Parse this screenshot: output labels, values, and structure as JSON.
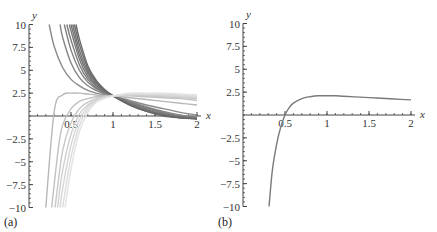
{
  "chart_data": [
    {
      "type": "line",
      "panel_label": "(a)",
      "title": "",
      "xlabel": "x",
      "ylabel": "y",
      "xlim": [
        0,
        2
      ],
      "ylim": [
        -10,
        10
      ],
      "x_ticks": [
        0.5,
        1,
        1.5,
        2
      ],
      "x_tick_labels": [
        "0.5",
        "1",
        "1.5",
        "2"
      ],
      "y_ticks": [
        -10,
        -7.5,
        -5,
        -2.5,
        2.5,
        5,
        7.5,
        10
      ],
      "y_tick_labels": [
        "−10",
        "−7.5",
        "−5",
        "−2.5",
        "2.5",
        "5",
        "7.5",
        "10"
      ],
      "grid": false,
      "legend": "none",
      "description": "Family of solution curves converging at (1, 2.2); upper curves diverge to +10 near x=0.24-0.55, lower curves diverge to -10 near x=0.21-0.40; fan spreads from y~2.5 to y~-0.3 at x=2",
      "series": [
        {
          "name": "upper-1",
          "color": "#8a8a8a",
          "x": [
            0.24,
            0.3,
            0.4,
            0.5,
            0.6,
            0.7,
            0.8,
            0.9,
            1.0,
            1.2,
            1.4,
            1.6,
            1.8,
            2.0
          ],
          "y": [
            10,
            7.6,
            5.3,
            4.0,
            3.3,
            2.8,
            2.5,
            2.3,
            2.2,
            1.7,
            1.2,
            0.8,
            0.4,
            0.1
          ]
        },
        {
          "name": "upper-2",
          "color": "#858585",
          "x": [
            0.37,
            0.4,
            0.5,
            0.6,
            0.7,
            0.8,
            0.9,
            1.0,
            1.2,
            1.4,
            1.6,
            1.8,
            2.0
          ],
          "y": [
            10,
            8.6,
            5.8,
            4.2,
            3.3,
            2.8,
            2.4,
            2.2,
            1.6,
            1.0,
            0.5,
            0.1,
            -0.1
          ]
        },
        {
          "name": "upper-3",
          "color": "#808080",
          "x": [
            0.42,
            0.5,
            0.6,
            0.7,
            0.8,
            0.9,
            1.0,
            1.2,
            1.4,
            1.6,
            1.8,
            2.0
          ],
          "y": [
            10,
            7.2,
            5.0,
            3.7,
            3.0,
            2.5,
            2.2,
            1.5,
            0.9,
            0.4,
            0.0,
            -0.2
          ]
        },
        {
          "name": "upper-4",
          "color": "#7c7c7c",
          "x": [
            0.45,
            0.5,
            0.6,
            0.7,
            0.8,
            0.9,
            1.0,
            1.2,
            1.4,
            1.6,
            1.8,
            2.0
          ],
          "y": [
            10,
            8.3,
            5.6,
            4.0,
            3.1,
            2.6,
            2.2,
            1.4,
            0.8,
            0.3,
            -0.1,
            -0.2
          ]
        },
        {
          "name": "upper-5",
          "color": "#787878",
          "x": [
            0.48,
            0.5,
            0.6,
            0.7,
            0.8,
            0.9,
            1.0,
            1.2,
            1.4,
            1.6,
            1.8,
            2.0
          ],
          "y": [
            10,
            9.3,
            6.2,
            4.3,
            3.3,
            2.6,
            2.2,
            1.4,
            0.7,
            0.2,
            -0.1,
            -0.3
          ]
        },
        {
          "name": "upper-6",
          "color": "#747474",
          "x": [
            0.5,
            0.6,
            0.7,
            0.8,
            0.9,
            1.0,
            1.2,
            1.4,
            1.6,
            1.8,
            2.0
          ],
          "y": [
            10,
            6.7,
            4.6,
            3.4,
            2.7,
            2.2,
            1.3,
            0.6,
            0.2,
            -0.1,
            -0.3
          ]
        },
        {
          "name": "upper-7",
          "color": "#707070",
          "x": [
            0.52,
            0.6,
            0.7,
            0.8,
            0.9,
            1.0,
            1.2,
            1.4,
            1.6,
            1.8,
            2.0
          ],
          "y": [
            10,
            7.2,
            4.9,
            3.6,
            2.8,
            2.2,
            1.3,
            0.6,
            0.1,
            -0.2,
            -0.3
          ]
        },
        {
          "name": "upper-8",
          "color": "#6c6c6c",
          "x": [
            0.54,
            0.6,
            0.7,
            0.8,
            0.9,
            1.0,
            1.2,
            1.4,
            1.6,
            1.8,
            2.0
          ],
          "y": [
            10,
            7.8,
            5.2,
            3.7,
            2.8,
            2.2,
            1.2,
            0.5,
            0.1,
            -0.2,
            -0.3
          ]
        },
        {
          "name": "upper-9",
          "color": "#686868",
          "x": [
            0.56,
            0.6,
            0.7,
            0.8,
            0.9,
            1.0,
            1.2,
            1.4,
            1.6,
            1.8,
            2.0
          ],
          "y": [
            10,
            8.4,
            5.5,
            3.9,
            2.9,
            2.2,
            1.2,
            0.5,
            0.0,
            -0.2,
            -0.3
          ]
        },
        {
          "name": "flat-1",
          "color": "#b8b8b8",
          "x": [
            0.2,
            0.3,
            0.4,
            0.5,
            0.6,
            0.7,
            0.8,
            0.9,
            1.0,
            1.2,
            1.4,
            1.6,
            1.8,
            2.0
          ],
          "y": [
            -10,
            0.5,
            2.3,
            2.5,
            2.5,
            2.4,
            2.3,
            2.25,
            2.2,
            2.0,
            1.8,
            1.6,
            1.4,
            1.2
          ]
        },
        {
          "name": "lower-1",
          "color": "#c0c0c0",
          "x": [
            0.27,
            0.35,
            0.4,
            0.5,
            0.6,
            0.7,
            0.8,
            0.9,
            1.0,
            1.2,
            1.4,
            1.6,
            1.8,
            2.0
          ],
          "y": [
            -10,
            -3.5,
            -1.0,
            0.8,
            1.6,
            1.9,
            2.1,
            2.15,
            2.2,
            2.2,
            2.1,
            2.0,
            1.9,
            1.7
          ]
        },
        {
          "name": "lower-2",
          "color": "#c8c8c8",
          "x": [
            0.31,
            0.4,
            0.5,
            0.6,
            0.7,
            0.8,
            0.9,
            1.0,
            1.2,
            1.4,
            1.6,
            1.8,
            2.0
          ],
          "y": [
            -10,
            -3.8,
            -0.7,
            0.8,
            1.5,
            1.9,
            2.1,
            2.2,
            2.3,
            2.2,
            2.1,
            2.0,
            1.9
          ]
        },
        {
          "name": "lower-3",
          "color": "#d0d0d0",
          "x": [
            0.34,
            0.4,
            0.5,
            0.6,
            0.7,
            0.8,
            0.9,
            1.0,
            1.2,
            1.4,
            1.6,
            1.8,
            2.0
          ],
          "y": [
            -10,
            -6.0,
            -2.0,
            0.2,
            1.2,
            1.8,
            2.0,
            2.2,
            2.3,
            2.3,
            2.2,
            2.1,
            2.0
          ]
        },
        {
          "name": "lower-4",
          "color": "#d6d6d6",
          "x": [
            0.37,
            0.4,
            0.5,
            0.6,
            0.7,
            0.8,
            0.9,
            1.0,
            1.2,
            1.4,
            1.6,
            1.8,
            2.0
          ],
          "y": [
            -10,
            -8.0,
            -3.2,
            -0.4,
            1.0,
            1.7,
            2.0,
            2.2,
            2.4,
            2.4,
            2.3,
            2.2,
            2.1
          ]
        },
        {
          "name": "lower-5",
          "color": "#dcdcdc",
          "x": [
            0.4,
            0.5,
            0.6,
            0.7,
            0.8,
            0.9,
            1.0,
            1.2,
            1.4,
            1.6,
            1.8,
            2.0
          ],
          "y": [
            -10,
            -4.5,
            -1.0,
            0.7,
            1.6,
            2.0,
            2.2,
            2.4,
            2.4,
            2.4,
            2.3,
            2.2
          ]
        },
        {
          "name": "lower-6",
          "color": "#e2e2e2",
          "x": [
            0.43,
            0.5,
            0.6,
            0.7,
            0.8,
            0.9,
            1.0,
            1.2,
            1.4,
            1.6,
            1.8,
            2.0
          ],
          "y": [
            -10,
            -5.8,
            -1.7,
            0.4,
            1.5,
            1.9,
            2.2,
            2.5,
            2.5,
            2.5,
            2.4,
            2.3
          ]
        }
      ]
    },
    {
      "type": "line",
      "panel_label": "(b)",
      "title": "",
      "xlabel": "x",
      "ylabel": "y",
      "xlim": [
        0,
        2
      ],
      "ylim": [
        -10,
        10
      ],
      "x_ticks": [
        0.5,
        1,
        1.5,
        2
      ],
      "x_tick_labels": [
        "0.5",
        "1",
        "1.5",
        "2"
      ],
      "y_ticks": [
        -10,
        -7.5,
        -5,
        -2.5,
        2.5,
        5,
        7.5,
        10
      ],
      "y_tick_labels": [
        "−10",
        "−7.5",
        "−5",
        "−2.5",
        "2.5",
        "5",
        "7.5",
        "10"
      ],
      "grid": false,
      "legend": "none",
      "series": [
        {
          "name": "solution",
          "color": "#7a7a7a",
          "x": [
            0.31,
            0.35,
            0.4,
            0.45,
            0.5,
            0.55,
            0.6,
            0.7,
            0.8,
            0.9,
            1.0,
            1.1,
            1.2,
            1.4,
            1.6,
            1.8,
            2.0
          ],
          "y": [
            -10,
            -6.0,
            -3.2,
            -1.3,
            0.0,
            0.8,
            1.3,
            1.8,
            2.0,
            2.1,
            2.1,
            2.1,
            2.05,
            1.95,
            1.85,
            1.75,
            1.65
          ]
        }
      ]
    }
  ],
  "panels": [
    {
      "label": "(a)",
      "x_axis_label": "x",
      "y_axis_label": "y"
    },
    {
      "label": "(b)",
      "x_axis_label": "x",
      "y_axis_label": "y"
    }
  ]
}
